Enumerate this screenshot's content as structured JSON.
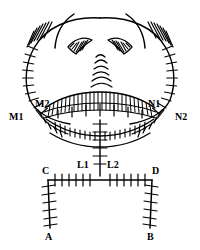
{
  "figure": {
    "type": "scientific-line-drawing",
    "background_color": "#ffffff",
    "ink_color": "#000000"
  },
  "labels": {
    "m1": "M1",
    "m2": "M2",
    "n1": "N1",
    "n2": "N2",
    "l1": "L1",
    "l2": "L2",
    "c": "C",
    "d": "D",
    "a": "A",
    "b": "B"
  }
}
